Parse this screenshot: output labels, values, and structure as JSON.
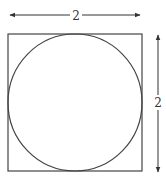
{
  "diagram": {
    "square": {
      "x": 8,
      "y": 34,
      "size": 134,
      "stroke": "#444444"
    },
    "circle": {
      "cx": 75,
      "cy": 103,
      "r": 67,
      "stroke": "#444444"
    },
    "width_dimension": {
      "label": "2",
      "y": 15,
      "x1": 9,
      "x2": 141
    },
    "height_dimension": {
      "label": "2",
      "x": 158,
      "y1": 33,
      "y2": 173
    }
  }
}
